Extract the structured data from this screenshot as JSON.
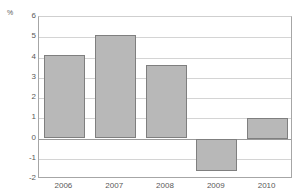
{
  "chart_data": {
    "type": "bar",
    "title": "",
    "subtitle": "",
    "xlabel": "",
    "ylabel": "%",
    "unit_label": "%",
    "categories": [
      "2006",
      "2007",
      "2008",
      "2009",
      "2010"
    ],
    "values": [
      4.1,
      5.1,
      3.65,
      -1.6,
      1.0
    ],
    "series": [
      {
        "name": "",
        "values": [
          4.1,
          5.1,
          3.65,
          -1.6,
          1.0
        ]
      }
    ],
    "ylim": [
      -2,
      6
    ],
    "ytick_values": [
      6,
      5,
      4,
      3,
      2,
      1,
      0,
      -1,
      -2
    ],
    "ytick_labels": [
      "6",
      "5",
      "4",
      "3",
      "2",
      "1",
      "0",
      "-1",
      "-2"
    ],
    "grid": true,
    "grid_axis": "y",
    "legend": false,
    "legend_position": "none",
    "zero_line": 0,
    "bar_color": "#b8b8b8",
    "bar_border_color": "#7f7f7f",
    "grid_color": "#d4d4d4",
    "axis_color": "#a6a6a6",
    "text_color": "#595959",
    "background_color": "#ffffff",
    "annotations": []
  }
}
